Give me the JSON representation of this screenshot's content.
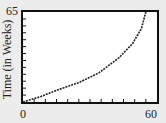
{
  "chart_data": {
    "type": "line",
    "title": "",
    "xlabel": "",
    "ylabel": "Time (in Weeks)",
    "xlim": [
      0,
      60
    ],
    "ylim": [
      0,
      65
    ],
    "x_tick_labels": [
      "0",
      "60"
    ],
    "y_tick_labels": [
      "65"
    ],
    "x_minor_tick_step": 5,
    "y_minor_tick_step": 5,
    "grid": false,
    "series": [
      {
        "name": "curve",
        "style": "dotted",
        "color": "#222222",
        "x": [
          0,
          8,
          16,
          25,
          34,
          43,
          49,
          53,
          55
        ],
        "y": [
          0,
          4,
          9,
          14,
          21,
          32,
          42,
          53,
          65
        ]
      }
    ]
  },
  "colors": {
    "background": "#ececec",
    "plot_bg": "#ffffff",
    "frame": "#111111",
    "line": "#222222"
  }
}
